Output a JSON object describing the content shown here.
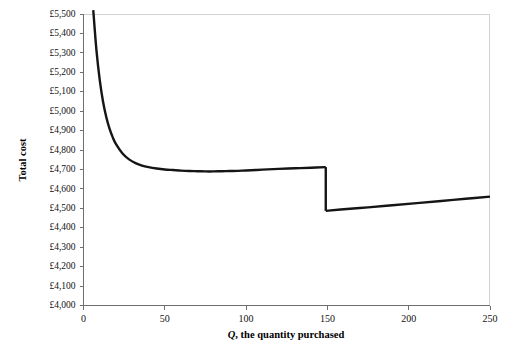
{
  "chart_data": {
    "type": "line",
    "title": "",
    "xlabel": "Q, the quantity purchased",
    "xlabel_italic_part": "Q",
    "xlabel_rest": ", the quantity purchased",
    "ylabel": "Total cost",
    "xlim": [
      0,
      250
    ],
    "ylim": [
      4000,
      5500
    ],
    "xticks": [
      0,
      50,
      100,
      150,
      200,
      250
    ],
    "xtick_labels": [
      "0",
      "50",
      "100",
      "150",
      "200",
      "250"
    ],
    "yticks": [
      4000,
      4100,
      4200,
      4300,
      4400,
      4500,
      4600,
      4700,
      4800,
      4900,
      5000,
      5100,
      5200,
      5300,
      5400,
      5500
    ],
    "ytick_labels": [
      "£4,000",
      "£4,100",
      "£4,200",
      "£4,300",
      "£4,400",
      "£4,500",
      "£4,600",
      "£4,700",
      "£4,800",
      "£4,900",
      "£5,000",
      "£5,100",
      "£5,200",
      "£5,300",
      "£5,400",
      "£5,500"
    ],
    "grid": false,
    "legend": false,
    "curve_color": "#151515",
    "axis_color": "#6f6f6f",
    "discount_break_q": 149,
    "series": [
      {
        "name": "Total cost before price break",
        "x": [
          6,
          8,
          10,
          12,
          14,
          16,
          18,
          20,
          24,
          28,
          32,
          36,
          40,
          45,
          50,
          55,
          60,
          65,
          70,
          75,
          80,
          85,
          90,
          95,
          100,
          110,
          120,
          130,
          140,
          149
        ],
        "values": [
          5520,
          5310,
          5160,
          5050,
          4970,
          4910,
          4865,
          4830,
          4782,
          4752,
          4733,
          4720,
          4712,
          4705,
          4700,
          4697,
          4694,
          4692,
          4691,
          4690,
          4690,
          4691,
          4692,
          4693,
          4695,
          4699,
          4703,
          4706,
          4709,
          4712
        ]
      },
      {
        "name": "Total cost after price break",
        "x": [
          149,
          160,
          175,
          190,
          205,
          220,
          235,
          250
        ],
        "values": [
          4487,
          4495,
          4505,
          4516,
          4527,
          4538,
          4549,
          4560
        ]
      }
    ],
    "annotations": [
      {
        "name": "price-break-drop",
        "x": 149,
        "from": 4712,
        "to": 4487,
        "description": "Vertical discontinuity at the quantity discount break point"
      }
    ]
  },
  "axes": {
    "y_axis_title": "Total cost",
    "x_axis_title_italic": "Q",
    "x_axis_title_rest": ", the quantity purchased"
  }
}
